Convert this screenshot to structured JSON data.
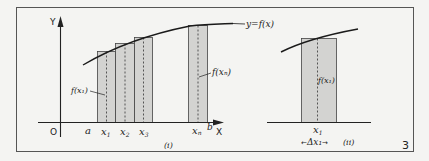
{
  "figure": {
    "number": "3",
    "colors": {
      "background": "#f4f4f2",
      "border": "#555555",
      "bar_fill": "#d3d3d1",
      "bar_stroke": "#444444",
      "line": "#1a1a1a"
    }
  },
  "panel_i": {
    "label": "(i)",
    "y_axis_label": "Y",
    "x_axis_label": "X",
    "origin_label": "O",
    "curve_label": "y=f(x)",
    "x_ticks": [
      "a",
      "x1",
      "x2",
      "x3",
      "xn",
      "b"
    ],
    "tick_labels": {
      "a": "a",
      "x1_base": "x",
      "x1_sub": "1",
      "x2_base": "x",
      "x2_sub": "2",
      "x3_base": "x",
      "x3_sub": "3",
      "xn_base": "x",
      "xn_sub": "n",
      "b": "b"
    },
    "annotations": {
      "f_x1": "f(x₁)",
      "f_xn": "f(xₙ)"
    },
    "bars": [
      {
        "name": "bar-1",
        "x_label": "x1"
      },
      {
        "name": "bar-2",
        "x_label": "x2"
      },
      {
        "name": "bar-3",
        "x_label": "x3"
      },
      {
        "name": "bar-n",
        "x_label": "xn"
      }
    ]
  },
  "panel_ii": {
    "label": "(ii)",
    "x_label_base": "x",
    "x_label_sub": "1",
    "height_label": "f(x₁)",
    "width_label": "Δx₁",
    "arrow_left": "←",
    "arrow_right": "→"
  }
}
